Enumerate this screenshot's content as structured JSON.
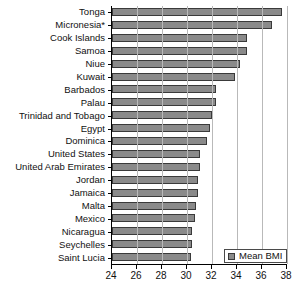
{
  "chart_data": {
    "type": "bar",
    "orientation": "horizontal",
    "title": "",
    "xlabel": "",
    "ylabel": "",
    "xlim": [
      24,
      38
    ],
    "xticks": [
      24,
      26,
      28,
      30,
      32,
      34,
      36,
      38
    ],
    "grid": true,
    "legend_position": "bottom-right",
    "series": [
      {
        "name": "Mean BMI",
        "color": "#8a8a8a",
        "values": [
          37.6,
          36.8,
          34.8,
          34.8,
          34.2,
          33.8,
          32.3,
          32.3,
          32.0,
          31.8,
          31.6,
          31.0,
          31.0,
          30.9,
          30.9,
          30.7,
          30.6,
          30.4,
          30.4,
          30.3
        ]
      }
    ],
    "categories": [
      "Tonga",
      "Micronesia*",
      "Cook Islands",
      "Samoa",
      "Niue",
      "Kuwait",
      "Barbados",
      "Palau",
      "Trinidad and Tobago",
      "Egypt",
      "Dominica",
      "United States",
      "United Arab Emirates",
      "Jordan",
      "Jamaica",
      "Malta",
      "Mexico",
      "Nicaragua",
      "Seychelles",
      "Saint Lucia"
    ]
  },
  "legend": {
    "label": "Mean BMI"
  },
  "footnote": {
    "text": ""
  }
}
